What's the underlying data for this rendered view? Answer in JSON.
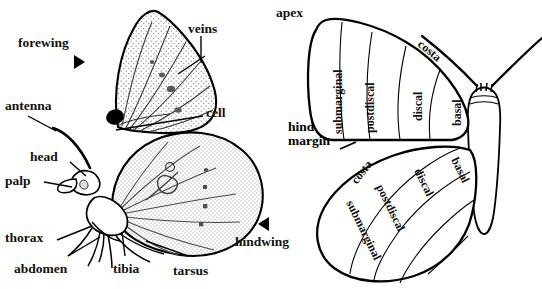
{
  "figure": {
    "background_color": "#ffffff",
    "ink_color": "#000000",
    "stipple_color": "#6b6b6b"
  },
  "left_panel": {
    "name": "lateral-view",
    "labels": [
      {
        "id": "forewing",
        "text": "forewing",
        "x": 18,
        "y": 36,
        "pointer": "triangle-right"
      },
      {
        "id": "veins",
        "text": "veins",
        "x": 188,
        "y": 22,
        "pointer": "leader-line"
      },
      {
        "id": "cell",
        "text": "cell",
        "x": 206,
        "y": 106,
        "pointer": "leader-line"
      },
      {
        "id": "antenna",
        "text": "antenna",
        "x": 5,
        "y": 99,
        "pointer": "leader-line"
      },
      {
        "id": "head",
        "text": "head",
        "x": 30,
        "y": 150,
        "pointer": "leader-line"
      },
      {
        "id": "palp",
        "text": "palp",
        "x": 5,
        "y": 174,
        "pointer": "leader-line"
      },
      {
        "id": "thorax",
        "text": "thorax",
        "x": 5,
        "y": 231,
        "pointer": "leader-line"
      },
      {
        "id": "abdomen",
        "text": "abdomen",
        "x": 14,
        "y": 262,
        "pointer": "leader-line"
      },
      {
        "id": "tibia",
        "text": "tibia",
        "x": 113,
        "y": 262,
        "pointer": "leader-line"
      },
      {
        "id": "tarsus",
        "text": "tarsus",
        "x": 173,
        "y": 264,
        "pointer": "leader-line"
      },
      {
        "id": "hindwing",
        "text": "hindwing",
        "x": 235,
        "y": 235,
        "pointer": "triangle-left"
      }
    ]
  },
  "right_panel": {
    "name": "wing-zones-view",
    "labels": [
      {
        "id": "apex",
        "text": "apex"
      },
      {
        "id": "hind-margin",
        "line1": "hind",
        "line2": "margin"
      }
    ],
    "forewing_zones": [
      {
        "id": "submarginal",
        "text": "submarginal",
        "x": 331,
        "y": 134,
        "rot": -90
      },
      {
        "id": "postdiscal",
        "text": "postdiscal",
        "x": 363,
        "y": 133,
        "rot": -90
      },
      {
        "id": "discal",
        "text": "discal",
        "x": 411,
        "y": 121,
        "rot": -90
      },
      {
        "id": "basal",
        "text": "basal",
        "x": 450,
        "y": 126,
        "rot": -90
      },
      {
        "id": "costa",
        "text": "costa",
        "x": 430,
        "y": 39,
        "rot": 39
      }
    ],
    "hindwing_zones": [
      {
        "id": "costa",
        "text": "costa",
        "x": 351,
        "y": 180,
        "rot": -52
      },
      {
        "id": "submarginal",
        "text": "submarginal",
        "x": 358,
        "y": 199,
        "rot": 64
      },
      {
        "id": "postdiscal",
        "text": "postdiscal",
        "x": 387,
        "y": 183,
        "rot": 64
      },
      {
        "id": "discal",
        "text": "discal",
        "x": 424,
        "y": 167,
        "rot": 64
      },
      {
        "id": "basal",
        "text": "basal",
        "x": 462,
        "y": 156,
        "rot": 64
      }
    ]
  }
}
